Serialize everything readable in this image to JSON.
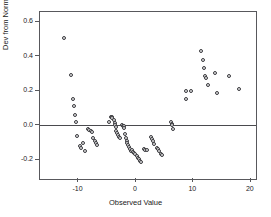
{
  "chart_data": {
    "type": "scatter",
    "title": "",
    "xlabel": "Observed Value",
    "ylabel": "Dev from Normal",
    "xlim": [
      -16.7,
      20.9
    ],
    "ylim": [
      -0.31,
      0.655
    ],
    "xticks": [
      -10,
      0,
      10,
      20
    ],
    "xticklabels": [
      "-10",
      "0",
      "10",
      "20"
    ],
    "yticks": [
      0.6,
      0.4,
      0.2,
      0.0,
      -0.2
    ],
    "yticklabels": [
      "0.6",
      "0.4",
      "0.2",
      "0.0",
      "-0.2"
    ],
    "grid": false,
    "legend": null,
    "reference_line": {
      "axis": "y",
      "value": 0.0
    },
    "marker": {
      "shape": "circle",
      "open": true,
      "edge_color": "#3a3a3e",
      "fill_color": "#e6e6e6",
      "size_px": 4
    },
    "series": [
      {
        "name": "Deviation from Normal",
        "points": [
          [
            -12.6,
            0.502
          ],
          [
            -11.3,
            0.289
          ],
          [
            -11.0,
            0.154
          ],
          [
            -10.8,
            0.11
          ],
          [
            -10.6,
            0.057
          ],
          [
            -10.5,
            0.019
          ],
          [
            -10.2,
            -0.063
          ],
          [
            -9.8,
            -0.12
          ],
          [
            -9.6,
            -0.128
          ],
          [
            -9.2,
            -0.101
          ],
          [
            -8.9,
            -0.148
          ],
          [
            -8.3,
            -0.023
          ],
          [
            -8.1,
            -0.028
          ],
          [
            -7.9,
            -0.034
          ],
          [
            -7.7,
            -0.04
          ],
          [
            -7.4,
            -0.074
          ],
          [
            -7.1,
            -0.09
          ],
          [
            -6.9,
            -0.104
          ],
          [
            -6.7,
            -0.112
          ],
          [
            -4.7,
            0.02
          ],
          [
            -4.3,
            0.046
          ],
          [
            -4.2,
            0.051
          ],
          [
            -4.1,
            0.041
          ],
          [
            -3.9,
            0.03
          ],
          [
            -3.7,
            0.012
          ],
          [
            -3.6,
            0.003
          ],
          [
            -3.5,
            -0.012
          ],
          [
            -3.4,
            -0.031
          ],
          [
            -3.3,
            -0.045
          ],
          [
            -3.1,
            -0.057
          ],
          [
            -3.0,
            -0.066
          ],
          [
            -2.8,
            -0.073
          ],
          [
            -2.5,
            0.003
          ],
          [
            -2.3,
            -0.001
          ],
          [
            -2.1,
            -0.006
          ],
          [
            -2.0,
            -0.014
          ],
          [
            -1.9,
            -0.05
          ],
          [
            -1.7,
            -0.073
          ],
          [
            -1.6,
            -0.088
          ],
          [
            -1.5,
            -0.103
          ],
          [
            -1.4,
            -0.115
          ],
          [
            -1.2,
            -0.125
          ],
          [
            -1.0,
            -0.137
          ],
          [
            -0.8,
            -0.146
          ],
          [
            -0.6,
            -0.143
          ],
          [
            -0.5,
            -0.152
          ],
          [
            -0.3,
            -0.16
          ],
          [
            -0.1,
            -0.168
          ],
          [
            0.1,
            -0.176
          ],
          [
            0.3,
            -0.187
          ],
          [
            0.5,
            -0.196
          ],
          [
            0.7,
            -0.205
          ],
          [
            0.9,
            -0.211
          ],
          [
            1.4,
            -0.134
          ],
          [
            1.6,
            -0.14
          ],
          [
            1.9,
            -0.145
          ],
          [
            2.6,
            -0.07
          ],
          [
            2.8,
            -0.08
          ],
          [
            3.0,
            -0.093
          ],
          [
            3.2,
            -0.106
          ],
          [
            3.6,
            -0.13
          ],
          [
            3.8,
            -0.138
          ],
          [
            4.0,
            -0.15
          ],
          [
            4.3,
            -0.163
          ],
          [
            4.6,
            -0.17
          ],
          [
            6.1,
            0.019
          ],
          [
            6.2,
            0.01
          ],
          [
            6.3,
            0.001
          ],
          [
            6.5,
            -0.021
          ],
          [
            8.7,
            0.198
          ],
          [
            8.8,
            0.15
          ],
          [
            9.5,
            0.201
          ],
          [
            11.4,
            0.427
          ],
          [
            11.6,
            0.377
          ],
          [
            11.8,
            0.329
          ],
          [
            12.1,
            0.283
          ],
          [
            12.2,
            0.276
          ],
          [
            12.5,
            0.236
          ],
          [
            13.8,
            0.302
          ],
          [
            14.1,
            0.187
          ],
          [
            16.2,
            0.285
          ],
          [
            17.9,
            0.209
          ]
        ]
      }
    ]
  },
  "axes": {
    "frame_color": "#58585c",
    "zero_line_color": "#4a4a4e"
  }
}
